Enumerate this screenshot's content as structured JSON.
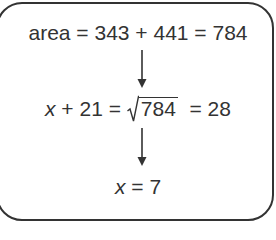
{
  "diagram": {
    "type": "flow-of-equations",
    "colors": {
      "ink": "#333333",
      "background": "#ffffff"
    },
    "steps": [
      {
        "lhs": "area",
        "eq1": "=",
        "term1": "343",
        "plus": "+",
        "term2": "441",
        "eq2": "=",
        "result": "784"
      },
      {
        "var": "x",
        "plus": "+",
        "const": "21",
        "eq1": "=",
        "sqrt_symbol": "√",
        "radicand": "784",
        "eq2": "=",
        "result": "28"
      },
      {
        "var": "x",
        "eq": "=",
        "result": "7"
      }
    ],
    "arrows": [
      {
        "from": 0,
        "to": 1,
        "icon": "arrow-down-icon"
      },
      {
        "from": 1,
        "to": 2,
        "icon": "arrow-down-icon"
      }
    ]
  }
}
